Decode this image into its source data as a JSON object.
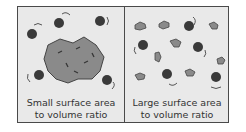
{
  "panels": [
    {
      "id": "small",
      "caption_line1": "Small surface area",
      "caption_line2": "to volume ratio"
    },
    {
      "id": "large",
      "caption_line1": "Large surface area",
      "caption_line2": "to volume ratio"
    }
  ],
  "colors": {
    "frame": "#4a4a4a",
    "background": "#e9e9e9",
    "solid": "#8a8a8a",
    "particle": "#3a3a3a"
  }
}
